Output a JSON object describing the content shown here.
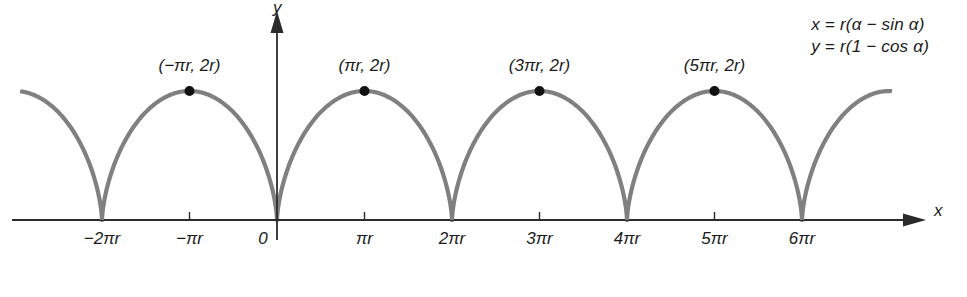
{
  "figure": {
    "curve_color": "#808080",
    "axis_color": "#2b2b2b",
    "point_color": "#111111",
    "equations": [
      "x = r(α − sin α)",
      "y = r(1 − cos α)"
    ],
    "axis_labels": {
      "x": "x",
      "y": "y"
    }
  },
  "chart_data": {
    "type": "line",
    "title": "",
    "xlabel": "x",
    "ylabel": "y",
    "grid": false,
    "legend": "none",
    "parametric": {
      "x": "r(α − sin α)",
      "y": "r(1 − cos α)",
      "parameter": "α"
    },
    "xlim": [
      -2.6,
      7.0
    ],
    "ylim": [
      0,
      2
    ],
    "xunit": "πr",
    "yunit": "r",
    "xticks": [
      {
        "value": -2,
        "label": "−2πr",
        "cusp": true
      },
      {
        "value": -1,
        "label": "−πr",
        "cusp": false
      },
      {
        "value": 0,
        "label": "0",
        "cusp": true
      },
      {
        "value": 1,
        "label": "πr",
        "cusp": false
      },
      {
        "value": 2,
        "label": "2πr",
        "cusp": true
      },
      {
        "value": 3,
        "label": "3πr",
        "cusp": false
      },
      {
        "value": 4,
        "label": "4πr",
        "cusp": true
      },
      {
        "value": 5,
        "label": "5πr",
        "cusp": false
      },
      {
        "value": 6,
        "label": "6πr",
        "cusp": true
      }
    ],
    "marked_points": [
      {
        "x": -1,
        "y": 2,
        "label": "(−πr, 2r)"
      },
      {
        "x": 1,
        "y": 2,
        "label": "(πr, 2r)"
      },
      {
        "x": 3,
        "y": 2,
        "label": "(3πr, 2r)"
      },
      {
        "x": 5,
        "y": 2,
        "label": "(5πr, 2r)"
      }
    ],
    "arches": [
      {
        "start": -4,
        "end": -2,
        "partial": true
      },
      {
        "start": -2,
        "end": 0,
        "partial": false
      },
      {
        "start": 0,
        "end": 2,
        "partial": false
      },
      {
        "start": 2,
        "end": 4,
        "partial": false
      },
      {
        "start": 4,
        "end": 6,
        "partial": false
      },
      {
        "start": 6,
        "end": 8,
        "partial": true
      }
    ]
  }
}
